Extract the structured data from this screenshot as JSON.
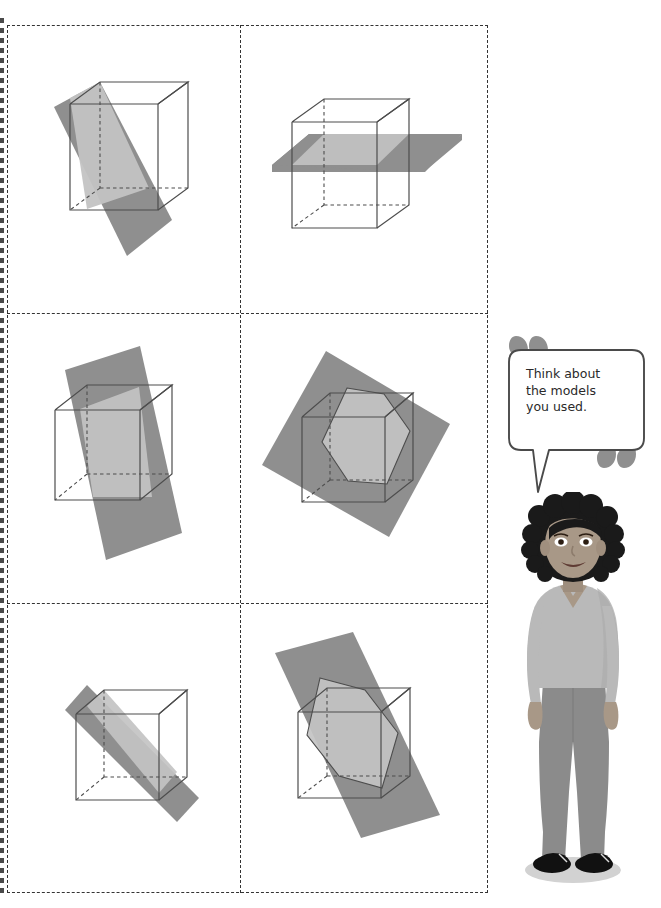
{
  "page": {
    "background_color": "#ffffff"
  },
  "colors": {
    "plane_dark": "#8f8f8f",
    "plane_light": "#c3c3c3",
    "cube_line": "#4d4d4d",
    "grid_dash": "#333333",
    "bubble_outline": "#4a4a4a",
    "quote_mark": "#8f8f8f",
    "skin": "#a89887",
    "hair": "#1a1a1a",
    "shirt": "#b9b9b9",
    "pants": "#8b8b8b",
    "shoe": "#111111",
    "shadow": "#cccccc",
    "text": "#2a2a2a"
  },
  "grid": {
    "rows": 3,
    "columns": 2,
    "border_style": "dashed",
    "cells": [
      {
        "id": "cell-1",
        "position": "top-left",
        "name": "vertical-diagonal-plane-through-cube",
        "description": "Cube with a vertical plane slicing diagonally through it, plane extends beyond cube on the left and bottom"
      },
      {
        "id": "cell-2",
        "position": "top-right",
        "name": "horizontal-plane-through-cube",
        "description": "Cube with a horizontal plane cutting it parallel to the top and bottom faces"
      },
      {
        "id": "cell-3",
        "position": "middle-left",
        "name": "tilted-vertical-plane-through-cube",
        "description": "Cube with a slightly tilted vertical plane cutting through front to back"
      },
      {
        "id": "cell-4",
        "position": "middle-right",
        "name": "oblique-plane-hexagonal-section",
        "description": "Cube with an oblique plane producing a hexagonal cross section"
      },
      {
        "id": "cell-5",
        "position": "bottom-left",
        "name": "diagonal-rectangular-plane-through-cube",
        "description": "Cube with a narrow diagonal plane producing a rectangular cross section through two opposite edges"
      },
      {
        "id": "cell-6",
        "position": "bottom-right",
        "name": "steep-oblique-plane-hexagonal-section",
        "description": "Cube with a steeply tilted oblique plane producing a hexagonal cross section"
      }
    ]
  },
  "callout": {
    "speaker": "student-character",
    "text": "Think about\nthe models\nyou used.",
    "open_quote_icon": "quote-open-icon",
    "close_quote_icon": "quote-close-icon"
  },
  "character": {
    "name": "standing-student-figure",
    "pose": "standing",
    "hair": "curly-short",
    "top": "long-sleeve-v-neck",
    "bottom": "trousers",
    "shoes": "flats"
  }
}
